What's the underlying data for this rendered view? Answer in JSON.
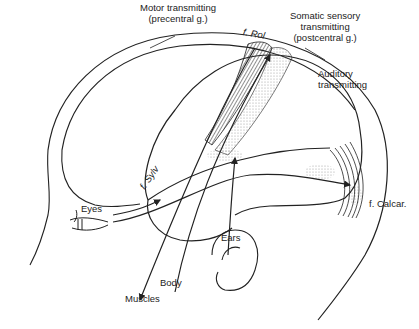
{
  "figure": {
    "type": "anatomical line drawing"
  },
  "labels": {
    "motor_line1": "Motor transmitting",
    "motor_line2": "(precentral g.)",
    "somatic_line1": "Somatic sensory",
    "somatic_line2": "transmitting",
    "somatic_line3": "(postcentral g.)",
    "auditory_line1": "Auditory",
    "auditory_line2": "transmitting",
    "f_rol": "f. Rol",
    "f_sylv": "f. Sylv",
    "f_calcar": "f. Calcar.",
    "eyes": "Eyes",
    "ears": "Ears",
    "body": "Body",
    "muscles": "Muscles"
  },
  "colors": {
    "ink": "#222222",
    "stipple": "#999999",
    "background": "#ffffff"
  }
}
